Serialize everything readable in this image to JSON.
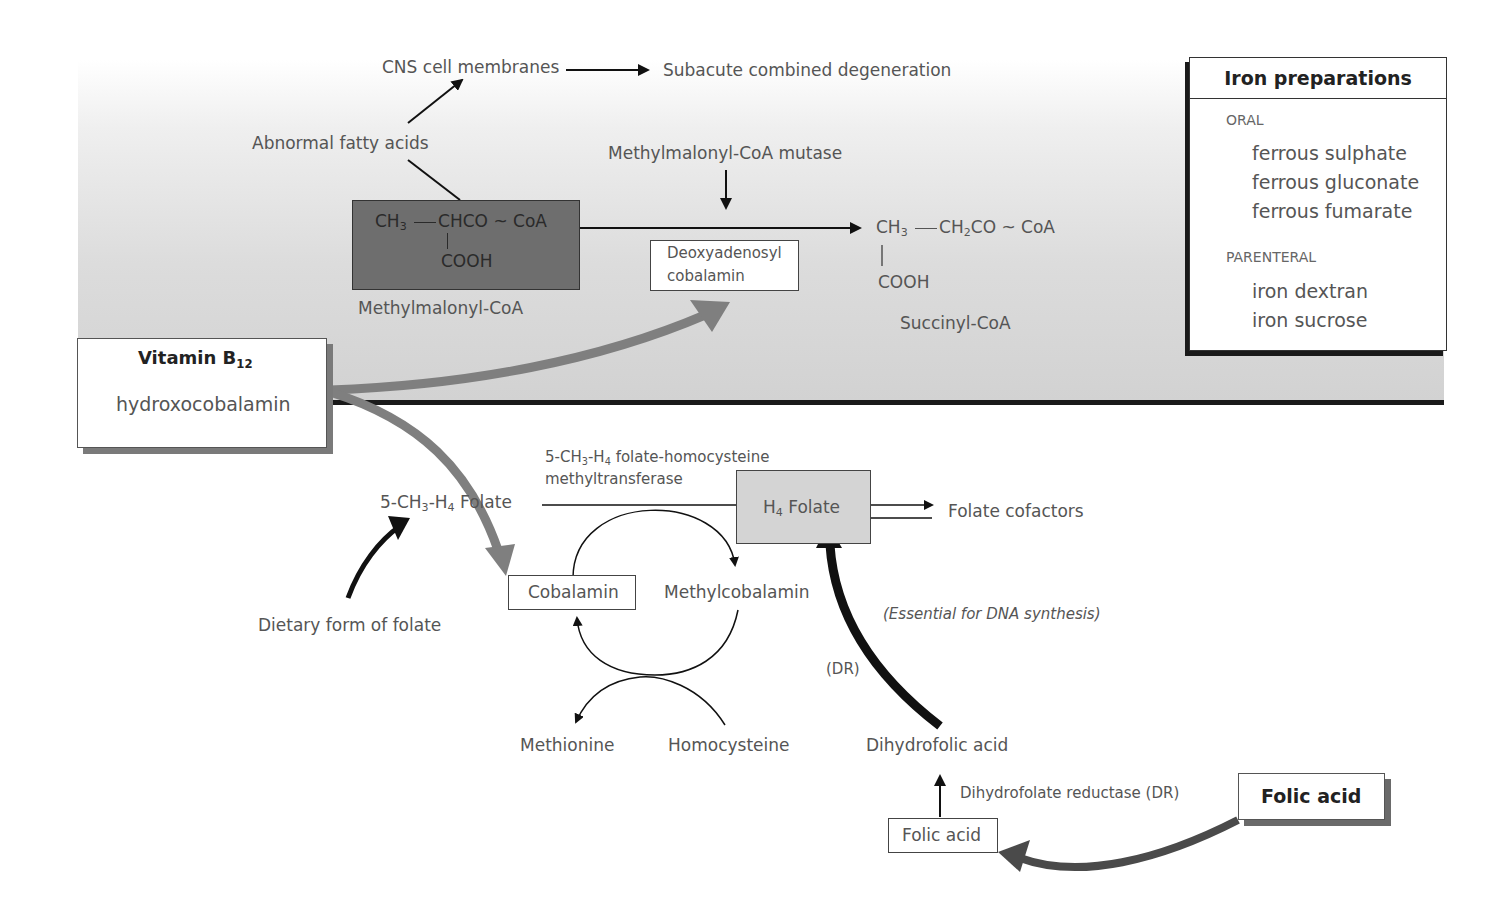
{
  "diagram": {
    "top_panel": {
      "cns_membranes": "CNS cell membranes",
      "subacute": "Subacute combined degeneration",
      "abnormal_fatty_acids": "Abnormal fatty acids",
      "mutase": "Methylmalonyl-CoA mutase",
      "methylmalonyl_formula": {
        "ch3": "CH",
        "ch3_sub": "3",
        "rest": "CHCO ~ CoA",
        "cooh": "COOH"
      },
      "methylmalonyl_label": "Methylmalonyl-CoA",
      "deoxyadenosyl_line1": "Deoxyadenosyl",
      "deoxyadenosyl_line2": "cobalamin",
      "succinyl_formula": {
        "ch3": "CH",
        "ch3_sub": "3",
        "ch2": "CH",
        "ch2_sub": "2",
        "rest": "CO ~ CoA",
        "cooh": "COOH"
      },
      "succinyl_label": "Succinyl-CoA"
    },
    "vitamin_b12_box": {
      "title": "Vitamin B",
      "title_sub": "12",
      "subtitle": "hydroxocobalamin"
    },
    "iron_box": {
      "title": "Iron preparations",
      "sections": [
        {
          "heading": "ORAL",
          "items": [
            "ferrous sulphate",
            "ferrous gluconate",
            "ferrous fumarate"
          ]
        },
        {
          "heading": "PARENTERAL",
          "items": [
            "iron dextran",
            "iron sucrose"
          ]
        }
      ]
    },
    "bottom_panel": {
      "methyl_folate": {
        "a": "5-CH",
        "a_sub": "3",
        "b": "-H",
        "b_sub": "4",
        "c": " Folate"
      },
      "enzyme_line1": {
        "a": "5-CH",
        "a_sub": "3",
        "b": "-H",
        "b_sub": "4",
        "c": " folate-homocysteine"
      },
      "enzyme_line2": "methyltransferase",
      "h4_folate": {
        "a": "H",
        "a_sub": "4",
        "b": " Folate"
      },
      "folate_cofactors": "Folate cofactors",
      "essential_note": "(Essential for DNA synthesis)",
      "dietary_folate": "Dietary form of folate",
      "cobalamin": "Cobalamin",
      "methylcobalamin": "Methylcobalamin",
      "methionine": "Methionine",
      "homocysteine": "Homocysteine",
      "dr_label": "(DR)",
      "dihydrofolic_acid": "Dihydrofolic acid",
      "dhfr": "Dihydrofolate reductase (DR)",
      "folic_acid_small": "Folic acid",
      "folic_acid_big": "Folic acid"
    },
    "colors": {
      "band_gray": "#d2d2d2",
      "dark_box": "#6e6e6e",
      "h4_box": "#d4d4d4",
      "grey_arrow": "#7f7f7f",
      "black_arrow": "#111111",
      "folic_arrow": "#4a4a4a"
    }
  }
}
